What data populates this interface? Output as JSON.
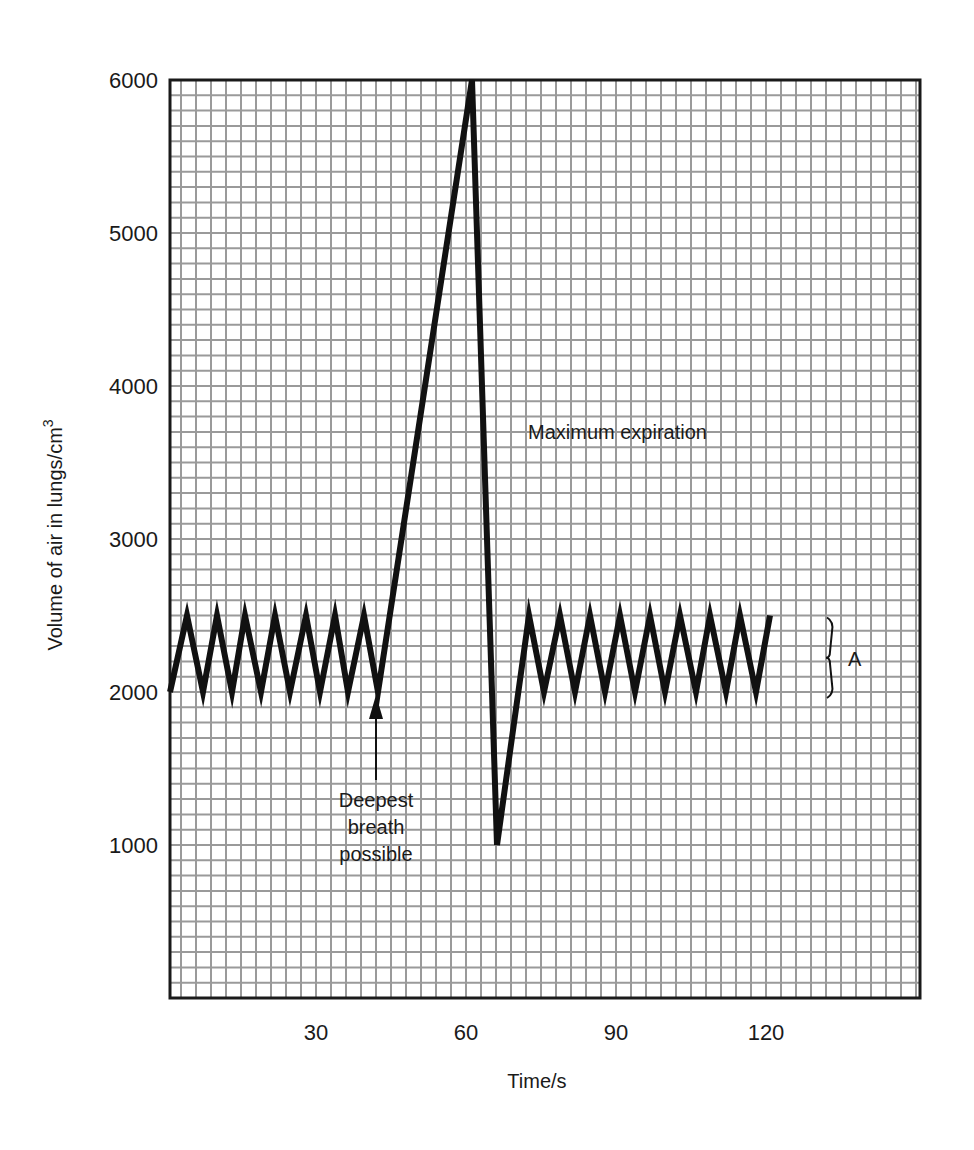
{
  "chart_data": {
    "type": "line",
    "title": "",
    "xlabel": "Time/s",
    "ylabel": "Volume of air in lungs/cm",
    "ylabel_superscript": "3",
    "xlim": [
      0,
      150
    ],
    "ylim": [
      0,
      6000
    ],
    "grid": true,
    "grid_minor_x_step": 3,
    "grid_minor_y_step": 100,
    "x_ticks": [
      30,
      60,
      90,
      120
    ],
    "x_tick_labels": [
      "30",
      "60",
      "90",
      "120"
    ],
    "y_ticks": [
      1000,
      2000,
      3000,
      4000,
      5000,
      6000
    ],
    "y_tick_labels": [
      "1000",
      "2000",
      "3000",
      "4000",
      "5000",
      "6000"
    ],
    "series": [
      {
        "name": "Lung volume",
        "color": "#111111",
        "points": [
          [
            0.8,
            2000
          ],
          [
            4.2,
            2500
          ],
          [
            7.4,
            2000
          ],
          [
            10.2,
            2500
          ],
          [
            13.2,
            2000
          ],
          [
            15.8,
            2500
          ],
          [
            19.0,
            2000
          ],
          [
            21.8,
            2500
          ],
          [
            24.8,
            2000
          ],
          [
            28.0,
            2500
          ],
          [
            30.8,
            2000
          ],
          [
            33.8,
            2500
          ],
          [
            36.4,
            2000
          ],
          [
            39.6,
            2500
          ],
          [
            42.4,
            2000
          ],
          [
            61.2,
            6000
          ],
          [
            66.2,
            1000
          ],
          [
            72.6,
            2500
          ],
          [
            75.6,
            2000
          ],
          [
            78.8,
            2500
          ],
          [
            81.8,
            2000
          ],
          [
            84.8,
            2500
          ],
          [
            87.8,
            2000
          ],
          [
            90.8,
            2500
          ],
          [
            93.8,
            2000
          ],
          [
            96.8,
            2500
          ],
          [
            99.8,
            2000
          ],
          [
            102.8,
            2500
          ],
          [
            106.0,
            2000
          ],
          [
            108.8,
            2500
          ],
          [
            112.0,
            2000
          ],
          [
            114.8,
            2500
          ],
          [
            118.0,
            2000
          ],
          [
            120.8,
            2500
          ]
        ]
      }
    ],
    "annotations": [
      {
        "id": "deepest-breath",
        "lines": [
          "Deepest",
          "breath",
          "possible"
        ],
        "arrow_to": [
          42.4,
          2000
        ]
      },
      {
        "id": "maximum-expiration",
        "text": "Maximum expiration",
        "at": [
          72,
          3700
        ]
      },
      {
        "id": "brace-A",
        "text": "A",
        "spans": [
          2000,
          2500
        ],
        "at_x": 133
      }
    ]
  }
}
